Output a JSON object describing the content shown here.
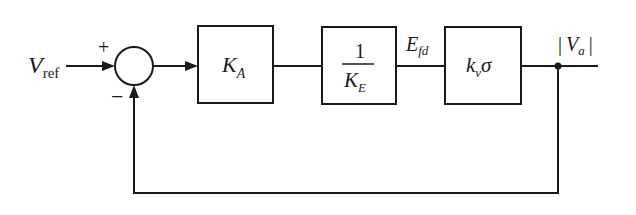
{
  "diagram": {
    "type": "control-block-diagram",
    "input": {
      "symbol": "V",
      "subscript": "ref"
    },
    "summing_junction": {
      "plus_sign": "+",
      "minus_sign": "−"
    },
    "blocks": [
      {
        "id": "amplifier",
        "main": "K",
        "subscript": "A"
      },
      {
        "id": "exciter",
        "numerator": "1",
        "denominator_main": "K",
        "denominator_subscript": "E"
      },
      {
        "id": "generator",
        "main": "k",
        "subscript": "v",
        "suffix": "σ"
      }
    ],
    "signals": {
      "exciter_output": {
        "symbol": "E",
        "subscript": "fd"
      },
      "output": {
        "bar_left": "|",
        "symbol": "V",
        "subscript": "a",
        "bar_right": "|"
      }
    },
    "feedback": {
      "type": "unity-negative"
    }
  }
}
